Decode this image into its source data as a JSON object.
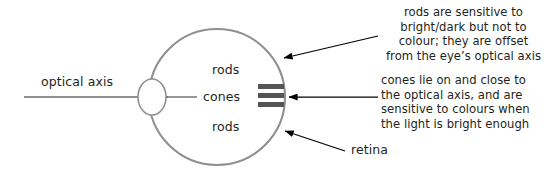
{
  "diagram": {
    "colors": {
      "eye_outline": "#909090",
      "lens_outline": "#909090",
      "axis_line": "#6b6b6b",
      "cone_bar": "#555555",
      "arrow": "#000000",
      "text": "#231f20",
      "background": "#ffffff"
    },
    "labels": {
      "optical_axis": "optical axis",
      "rods_top": "rods",
      "cones": "cones",
      "rods_bottom": "rods",
      "retina": "retina"
    },
    "notes": {
      "rods_note": "rods are sensitive to\nbright/dark but not to\ncolour; they are offset\nfrom the eye’s optical axis",
      "cones_note": "cones lie on and close to\nthe optical axis, and are\nsensitive to colours when\nthe light is bright enough"
    },
    "geometry": {
      "eye_center_x": 217,
      "eye_center_y": 97,
      "eye_radius": 68,
      "lens_center_x": 152,
      "lens_center_y": 97,
      "lens_rx": 14,
      "lens_ry": 18,
      "axis_y": 97,
      "axis_start_x": 24,
      "cone_bar_count": 3,
      "cone_bar_x": 258,
      "cone_bar_width": 26,
      "cone_bar_height": 5,
      "cone_bar_ys": [
        86,
        94.5,
        103
      ]
    }
  }
}
